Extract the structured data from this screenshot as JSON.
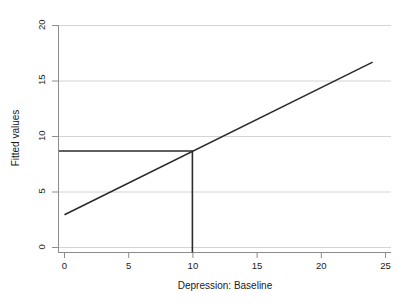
{
  "chart_data": {
    "type": "line",
    "title": "",
    "xlabel": "Depression: Baseline",
    "ylabel": "Fitted values",
    "xlim": [
      0,
      25
    ],
    "ylim": [
      0,
      20
    ],
    "xticks": [
      0,
      5,
      10,
      15,
      20,
      25
    ],
    "yticks": [
      0,
      5,
      10,
      15,
      20
    ],
    "xtick_labels": [
      "0",
      "5",
      "10",
      "15",
      "20",
      "25"
    ],
    "ytick_labels": [
      "0",
      "5",
      "10",
      "15",
      "20"
    ],
    "grid": "horizontal",
    "legend": "none",
    "series": [
      {
        "name": "Fitted values",
        "type": "line",
        "x": [
          0,
          24
        ],
        "y": [
          2.95,
          16.7
        ],
        "color": "#2b2b2b",
        "width": 1.6
      },
      {
        "name": "horizontal reference",
        "type": "line",
        "x": [
          0,
          10
        ],
        "y": [
          8.7,
          8.7
        ],
        "color": "#2b2b2b",
        "width": 1.6
      },
      {
        "name": "vertical reference",
        "type": "line",
        "x": [
          10,
          10
        ],
        "y": [
          0,
          8.7
        ],
        "color": "#2b2b2b",
        "width": 1.6
      }
    ],
    "annotations": {
      "reference_x": 10,
      "reference_y": 8.7,
      "fit_intercept": 2.95,
      "fit_slope": 0.573
    },
    "colors": {
      "grid": "#d4d4d4",
      "axis": "#8c8c8c",
      "line": "#2b2b2b",
      "text": "#1a1a1a",
      "background": "#ffffff"
    }
  }
}
